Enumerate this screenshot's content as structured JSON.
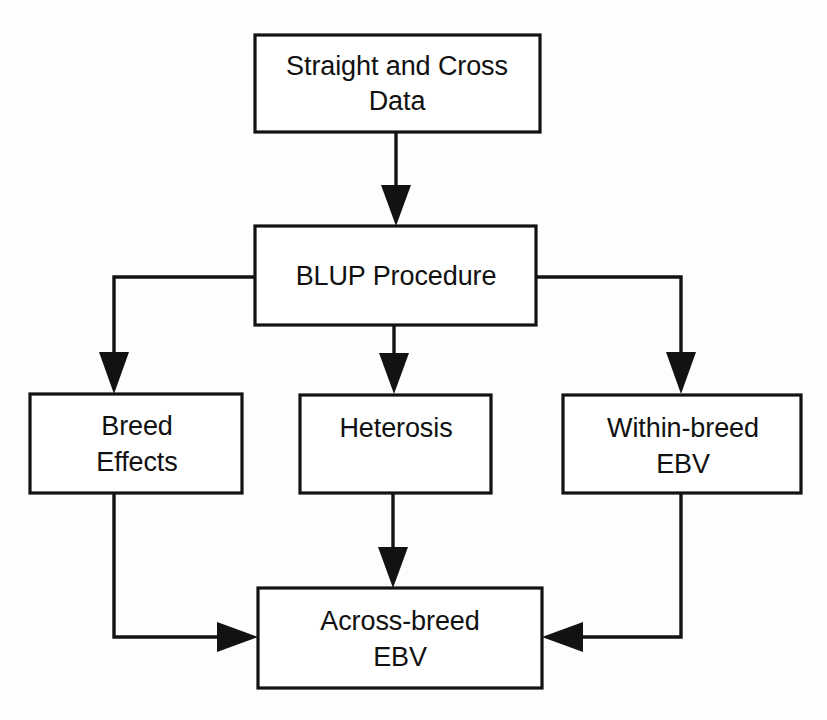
{
  "diagram": {
    "background_color": "#fdfdfd",
    "line_color": "#121212",
    "box_fill_color": "#ffffff",
    "nodes": [
      {
        "id": "straight-and-cross-data",
        "line1": "Straight and Cross",
        "line2": "Data"
      },
      {
        "id": "blup-procedure",
        "line1": "BLUP Procedure",
        "line2": ""
      },
      {
        "id": "breed-effects",
        "line1": "Breed",
        "line2": "Effects"
      },
      {
        "id": "heterosis",
        "line1": "Heterosis",
        "line2": ""
      },
      {
        "id": "within-breed-ebv",
        "line1": "Within-breed",
        "line2": "EBV"
      },
      {
        "id": "across-breed-ebv",
        "line1": "Across-breed",
        "line2": "EBV"
      }
    ],
    "edges": [
      {
        "id": "data-to-blup",
        "from": "straight-and-cross-data",
        "to": "blup-procedure"
      },
      {
        "id": "blup-to-breed-effects",
        "from": "blup-procedure",
        "to": "breed-effects"
      },
      {
        "id": "blup-to-heterosis",
        "from": "blup-procedure",
        "to": "heterosis"
      },
      {
        "id": "blup-to-within-breed-ebv",
        "from": "blup-procedure",
        "to": "within-breed-ebv"
      },
      {
        "id": "breed-effects-to-across-breed-ebv",
        "from": "breed-effects",
        "to": "across-breed-ebv"
      },
      {
        "id": "heterosis-to-across-breed-ebv",
        "from": "heterosis",
        "to": "across-breed-ebv"
      },
      {
        "id": "within-breed-ebv-to-across-breed-ebv",
        "from": "within-breed-ebv",
        "to": "across-breed-ebv"
      }
    ]
  }
}
